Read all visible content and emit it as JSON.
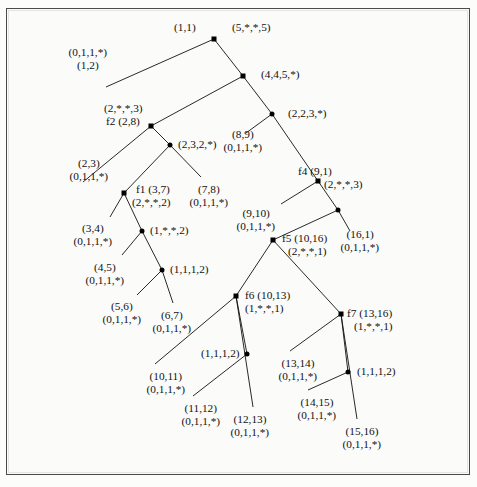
{
  "figure": {
    "kind": "binary-decomposition-tree",
    "background": "#fbfbfa",
    "ink": "#111111",
    "node_color": "#000000"
  },
  "nodes": [
    {
      "id": "n1",
      "shape": "square",
      "x": 214,
      "y": 39,
      "labels": [
        "(1,1)",
        "(5,*,*,5)"
      ]
    },
    {
      "id": "n2",
      "shape": "square",
      "x": 243,
      "y": 76,
      "labels": [
        "(4,4,5,*)"
      ]
    },
    {
      "id": "n3",
      "shape": "dot",
      "x": 272,
      "y": 114,
      "labels": [
        "(2,2,3,*)"
      ]
    },
    {
      "id": "f2",
      "shape": "square",
      "x": 151,
      "y": 126,
      "labels": [
        "(2,*,*,3)",
        "f2 (2,8)"
      ]
    },
    {
      "id": "n5",
      "shape": "dot",
      "x": 170,
      "y": 145,
      "labels": [
        "(2,3,2,*)"
      ]
    },
    {
      "id": "f4",
      "shape": "square",
      "x": 318,
      "y": 181,
      "labels": [
        "f4 (9,1)",
        "(2,*,*,3)"
      ]
    },
    {
      "id": "f1",
      "shape": "square",
      "x": 124,
      "y": 193,
      "labels": [
        "f1 (3,7)",
        "(2,*,*,2)"
      ]
    },
    {
      "id": "n8",
      "shape": "dot",
      "x": 338,
      "y": 210,
      "labels": []
    },
    {
      "id": "n9",
      "shape": "dot",
      "x": 142,
      "y": 231,
      "labels": [
        "(1,*,*,2)"
      ]
    },
    {
      "id": "f5",
      "shape": "square",
      "x": 273,
      "y": 240,
      "labels": [
        "f5 (10,16)",
        "(2,*,*,1)"
      ]
    },
    {
      "id": "n11",
      "shape": "dot",
      "x": 162,
      "y": 270,
      "labels": [
        "(1,1,1,2)"
      ]
    },
    {
      "id": "f6",
      "shape": "square",
      "x": 236,
      "y": 296,
      "labels": [
        "f6 (10,13)",
        "(1,*,*,1)"
      ]
    },
    {
      "id": "f7",
      "shape": "square",
      "x": 341,
      "y": 314,
      "labels": [
        "f7 (13,16)",
        "(1,*,*,1)"
      ]
    },
    {
      "id": "n14",
      "shape": "dot",
      "x": 247,
      "y": 354,
      "labels": [
        "(1,1,1,2)"
      ]
    },
    {
      "id": "n15",
      "shape": "dot",
      "x": 348,
      "y": 372,
      "labels": [
        "(1,1,1,2)"
      ]
    }
  ],
  "node_labels": [
    {
      "text": "(1,1)",
      "x": 196,
      "y": 21,
      "align": "right",
      "name": "label-root-1-1"
    },
    {
      "text": "(5,*,*,5)",
      "x": 232,
      "y": 21,
      "align": "left",
      "name": "label-root-5-5"
    },
    {
      "text": "(4,4,5,*)",
      "x": 261,
      "y": 68,
      "align": "left",
      "name": "label-4-4-5"
    },
    {
      "text": "(2,2,3,*)",
      "x": 288,
      "y": 107,
      "align": "left",
      "name": "label-2-2-3"
    },
    {
      "text": "(2,*,*,3)",
      "x": 104,
      "y": 102,
      "align": "left",
      "name": "label-f2-upper"
    },
    {
      "text": "f2 (2,8)",
      "x": 106,
      "y": 115,
      "align": "left",
      "name": "label-f2"
    },
    {
      "text": "(2,3,2,*)",
      "x": 178,
      "y": 138,
      "align": "left",
      "name": "label-2-3-2"
    },
    {
      "text": "f4 (9,1)",
      "x": 298,
      "y": 165,
      "align": "left",
      "name": "label-f4"
    },
    {
      "text": "(2,*,*,3)",
      "x": 324,
      "y": 178,
      "align": "left",
      "name": "label-f4-lower"
    },
    {
      "text": "f1 (3,7)",
      "x": 136,
      "y": 183,
      "align": "left",
      "name": "label-f1"
    },
    {
      "text": "(2,*,*,2)",
      "x": 132,
      "y": 196,
      "align": "left",
      "name": "label-f1-lower"
    },
    {
      "text": "(1,*,*,2)",
      "x": 150,
      "y": 224,
      "align": "left",
      "name": "label-1-2-mid"
    },
    {
      "text": "f5 (10,16)",
      "x": 282,
      "y": 232,
      "align": "left",
      "name": "label-f5"
    },
    {
      "text": "(2,*,*,1)",
      "x": 288,
      "y": 245,
      "align": "left",
      "name": "label-f5-lower"
    },
    {
      "text": "(1,1,1,2)",
      "x": 170,
      "y": 263,
      "align": "left",
      "name": "label-1112-left"
    },
    {
      "text": "f6 (10,13)",
      "x": 245,
      "y": 289,
      "align": "left",
      "name": "label-f6"
    },
    {
      "text": "(1,*,*,1)",
      "x": 245,
      "y": 302,
      "align": "left",
      "name": "label-f6-lower"
    },
    {
      "text": "f7 (13,16)",
      "x": 347,
      "y": 307,
      "align": "left",
      "name": "label-f7"
    },
    {
      "text": "(1,*,*,1)",
      "x": 354,
      "y": 320,
      "align": "left",
      "name": "label-f7-lower"
    },
    {
      "text": "(1,1,1,2)",
      "x": 240,
      "y": 347,
      "align": "right",
      "name": "label-1112-mid"
    },
    {
      "text": "(1,1,1,2)",
      "x": 357,
      "y": 365,
      "align": "left",
      "name": "label-1112-right"
    }
  ],
  "leaves": [
    {
      "name": "leaf-1-2",
      "lines": [
        "(0,1,1,*)",
        "(1,2)"
      ],
      "lx": 88,
      "ly": 46,
      "align": "center",
      "edge": {
        "x1": 214,
        "y1": 39,
        "x2": 106,
        "y2": 87
      }
    },
    {
      "name": "leaf-2-3",
      "lines": [
        "(2,3)",
        "(0,1,1,*)"
      ],
      "lx": 89,
      "ly": 157,
      "align": "center",
      "edge": {
        "x1": 151,
        "y1": 126,
        "x2": 83,
        "y2": 182
      }
    },
    {
      "name": "leaf-7-8",
      "lines": [
        "(7,8)",
        "(0,1,1,*)"
      ],
      "lx": 209,
      "ly": 183,
      "align": "center",
      "edge": {
        "x1": 170,
        "y1": 145,
        "x2": 201,
        "y2": 177
      }
    },
    {
      "name": "leaf-8-9",
      "lines": [
        "(8,9)",
        "(0,1,1,*)"
      ],
      "lx": 243,
      "ly": 128,
      "align": "center",
      "edge": {
        "x1": 272,
        "y1": 114,
        "x2": 246,
        "y2": 133
      }
    },
    {
      "name": "leaf-9-10",
      "lines": [
        "(9,10)",
        "(0,1,1,*)"
      ],
      "lx": 256,
      "ly": 207,
      "align": "center",
      "edge": {
        "x1": 318,
        "y1": 181,
        "x2": 281,
        "y2": 204
      }
    },
    {
      "name": "leaf-16-1",
      "lines": [
        "(16,1)",
        "(0,1,1,*)"
      ],
      "lx": 360,
      "ly": 228,
      "align": "center",
      "edge": {
        "x1": 338,
        "y1": 210,
        "x2": 350,
        "y2": 231
      }
    },
    {
      "name": "leaf-3-4",
      "lines": [
        "(3,4)",
        "(0,1,1,*)"
      ],
      "lx": 93,
      "ly": 222,
      "align": "center",
      "edge": {
        "x1": 124,
        "y1": 193,
        "x2": 110,
        "y2": 217
      }
    },
    {
      "name": "leaf-4-5",
      "lines": [
        "(4,5)",
        "(0,1,1,*)"
      ],
      "lx": 105,
      "ly": 261,
      "align": "center",
      "edge": {
        "x1": 142,
        "y1": 231,
        "x2": 122,
        "y2": 255
      }
    },
    {
      "name": "leaf-5-6",
      "lines": [
        "(5,6)",
        "(0,1,1,*)"
      ],
      "lx": 122,
      "ly": 300,
      "align": "center",
      "edge": {
        "x1": 162,
        "y1": 270,
        "x2": 137,
        "y2": 295
      }
    },
    {
      "name": "leaf-6-7",
      "lines": [
        "(6,7)",
        "(0,1,1,*)"
      ],
      "lx": 172,
      "ly": 309,
      "align": "center",
      "edge": {
        "x1": 162,
        "y1": 270,
        "x2": 173,
        "y2": 303
      }
    },
    {
      "name": "leaf-10-11",
      "lines": [
        "(10,11)",
        "(0,1,1,*)"
      ],
      "lx": 166,
      "ly": 370,
      "align": "center",
      "edge": {
        "x1": 236,
        "y1": 296,
        "x2": 155,
        "y2": 364
      }
    },
    {
      "name": "leaf-11-12",
      "lines": [
        "(11,12)",
        "(0,1,1,*)"
      ],
      "lx": 201,
      "ly": 402,
      "align": "center",
      "edge": {
        "x1": 247,
        "y1": 354,
        "x2": 193,
        "y2": 396
      }
    },
    {
      "name": "leaf-12-13",
      "lines": [
        "(12,13)",
        "(0,1,1,*)"
      ],
      "lx": 250,
      "ly": 413,
      "align": "center",
      "edge": {
        "x1": 236,
        "y1": 296,
        "x2": 253,
        "y2": 407
      }
    },
    {
      "name": "leaf-13-14",
      "lines": [
        "(13,14)",
        "(0,1,1,*)"
      ],
      "lx": 298,
      "ly": 357,
      "align": "center",
      "edge": {
        "x1": 341,
        "y1": 314,
        "x2": 290,
        "y2": 351
      }
    },
    {
      "name": "leaf-14-15",
      "lines": [
        "(14,15)",
        "(0,1,1,*)"
      ],
      "lx": 317,
      "ly": 396,
      "align": "center",
      "edge": {
        "x1": 348,
        "y1": 372,
        "x2": 308,
        "y2": 390
      }
    },
    {
      "name": "leaf-15-16",
      "lines": [
        "(15,16)",
        "(0,1,1,*)"
      ],
      "lx": 362,
      "ly": 425,
      "align": "center",
      "edge": {
        "x1": 341,
        "y1": 314,
        "x2": 357,
        "y2": 419
      }
    }
  ],
  "edges": [
    {
      "name": "edge-root-n2",
      "x1": 214,
      "y1": 39,
      "x2": 243,
      "y2": 76
    },
    {
      "name": "edge-n2-n3",
      "x1": 243,
      "y1": 76,
      "x2": 272,
      "y2": 114
    },
    {
      "name": "edge-n2-f2",
      "x1": 243,
      "y1": 76,
      "x2": 151,
      "y2": 126
    },
    {
      "name": "edge-f2-n5",
      "x1": 151,
      "y1": 126,
      "x2": 170,
      "y2": 145
    },
    {
      "name": "edge-n3-f4",
      "x1": 272,
      "y1": 114,
      "x2": 318,
      "y2": 181
    },
    {
      "name": "edge-n5-f1",
      "x1": 170,
      "y1": 145,
      "x2": 124,
      "y2": 193
    },
    {
      "name": "edge-f4-n8",
      "x1": 318,
      "y1": 181,
      "x2": 338,
      "y2": 210
    },
    {
      "name": "edge-f1-n9",
      "x1": 124,
      "y1": 193,
      "x2": 142,
      "y2": 231
    },
    {
      "name": "edge-n8-f5",
      "x1": 338,
      "y1": 210,
      "x2": 273,
      "y2": 240
    },
    {
      "name": "edge-n9-n11",
      "x1": 142,
      "y1": 231,
      "x2": 162,
      "y2": 270
    },
    {
      "name": "edge-f5-f6",
      "x1": 273,
      "y1": 240,
      "x2": 236,
      "y2": 296
    },
    {
      "name": "edge-f5-f7",
      "x1": 273,
      "y1": 240,
      "x2": 341,
      "y2": 314
    },
    {
      "name": "edge-f6-n14",
      "x1": 236,
      "y1": 296,
      "x2": 247,
      "y2": 354
    },
    {
      "name": "edge-f7-n15",
      "x1": 341,
      "y1": 314,
      "x2": 348,
      "y2": 372
    }
  ]
}
